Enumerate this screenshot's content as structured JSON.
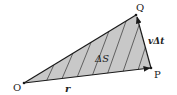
{
  "diagram": {
    "points": {
      "O": {
        "label": "O",
        "x": 24,
        "y": 83
      },
      "Q": {
        "label": "Q",
        "x": 136,
        "y": 15
      },
      "P": {
        "label": "P",
        "x": 151,
        "y": 68
      }
    },
    "labels": {
      "r": "r",
      "area": "ΔS",
      "displacement": "vΔt"
    },
    "colors": {
      "fill": "#c8c8c8",
      "stroke": "#1a1a1a",
      "hatch": "#333333"
    }
  }
}
